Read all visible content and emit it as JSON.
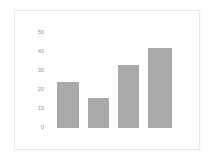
{
  "chart_data": {
    "type": "bar",
    "title": "",
    "subtitle": "",
    "xlabel": "",
    "ylabel": "",
    "categories": [
      "1",
      "2",
      "3",
      "4"
    ],
    "values": [
      24,
      16,
      33,
      42
    ],
    "series": [
      {
        "name": "series-1",
        "values": [
          24,
          16,
          33,
          42
        ]
      }
    ],
    "ylim": [
      0,
      50
    ],
    "yticks": [
      0,
      10,
      20,
      30,
      40,
      50
    ],
    "ytick_labels": [
      "0",
      "10",
      "20",
      "30",
      "40",
      "50"
    ],
    "xticks": [],
    "xtick_labels": [],
    "grid": false,
    "legend": null,
    "legend_position": "none",
    "annotations": [],
    "colors": {
      "bar": "#a9a9a9",
      "panel_background": "#ffffff",
      "panel_border": "#e9e9e9",
      "figure_background": "#ffffff",
      "tick_label": "#8e8e8e"
    }
  },
  "figure": {
    "panel_label": "",
    "caption": ""
  }
}
